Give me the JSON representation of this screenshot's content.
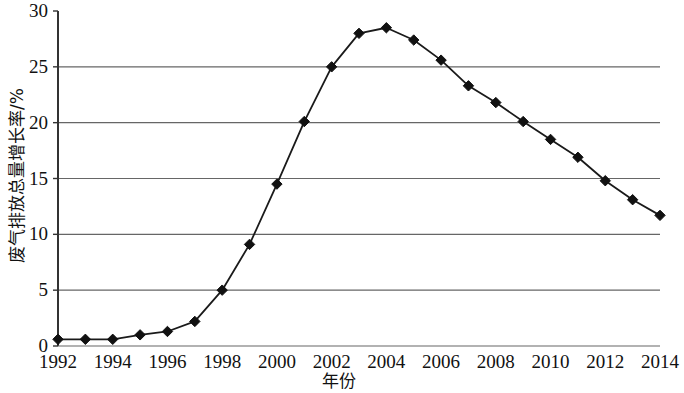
{
  "chart_data": {
    "type": "line",
    "title": "",
    "xlabel": "年份",
    "ylabel": "废气排放总量增长率/%",
    "xlim": [
      1992,
      2014
    ],
    "ylim": [
      0,
      30
    ],
    "ytick_labels": [
      "0",
      "5",
      "10",
      "15",
      "20",
      "25",
      "30"
    ],
    "yticks": [
      0,
      5,
      10,
      15,
      20,
      25,
      30
    ],
    "xtick_labels": [
      "1992",
      "1994",
      "1996",
      "1998",
      "2000",
      "2002",
      "2004",
      "2006",
      "2008",
      "2010",
      "2012",
      "2014"
    ],
    "xticks": [
      1992,
      1994,
      1996,
      1998,
      2000,
      2002,
      2004,
      2006,
      2008,
      2010,
      2012,
      2014
    ],
    "grid": "horizontal",
    "legend": "none",
    "marker": "diamond",
    "line_color": "#1a1a1a",
    "marker_color": "#111111",
    "grid_color": "#666666",
    "axis_color": "#333333",
    "x": [
      1992,
      1993,
      1994,
      1995,
      1996,
      1997,
      1998,
      1999,
      2000,
      2001,
      2002,
      2003,
      2004,
      2005,
      2006,
      2007,
      2008,
      2009,
      2010,
      2011,
      2012,
      2013,
      2014
    ],
    "values": [
      0.6,
      0.6,
      0.6,
      1.0,
      1.3,
      2.2,
      5.0,
      9.1,
      14.5,
      20.1,
      25.0,
      28.0,
      28.5,
      27.4,
      25.6,
      23.3,
      21.8,
      20.1,
      18.5,
      16.9,
      14.8,
      13.1,
      11.7
    ],
    "series": [
      {
        "name": "废气排放总量增长率",
        "values": [
          0.6,
          0.6,
          0.6,
          1.0,
          1.3,
          2.2,
          5.0,
          9.1,
          14.5,
          20.1,
          25.0,
          28.0,
          28.5,
          27.4,
          25.6,
          23.3,
          21.8,
          20.1,
          18.5,
          16.9,
          14.8,
          13.1,
          11.7
        ]
      }
    ]
  }
}
